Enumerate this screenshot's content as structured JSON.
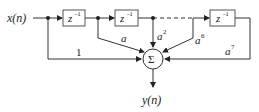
{
  "diagram": {
    "type": "block-diagram",
    "input_label": "x(n)",
    "output_label": "y(n)",
    "delay_blocks": [
      {
        "label": "z",
        "exponent": "-1"
      },
      {
        "label": "z",
        "exponent": "-1"
      },
      {
        "label": "z",
        "exponent": "-1"
      }
    ],
    "summer_label": "Σ",
    "coefficients": [
      {
        "base": "1",
        "exponent": ""
      },
      {
        "base": "a",
        "exponent": ""
      },
      {
        "base": "a",
        "exponent": "2"
      },
      {
        "base": "a",
        "exponent": "6"
      },
      {
        "base": "a",
        "exponent": "7"
      }
    ],
    "colors": {
      "line": "#333333",
      "box_stroke": "#555555",
      "text": "#222222"
    }
  }
}
